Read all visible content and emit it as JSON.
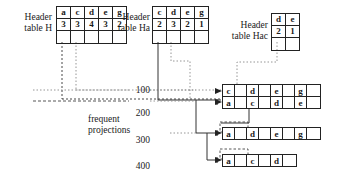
{
  "diagram": {
    "header_tables": [
      {
        "id": "H",
        "label_line1": "Header",
        "label_line2": "table H",
        "items": [
          "a",
          "c",
          "d",
          "e",
          "g"
        ],
        "counts": [
          "3",
          "3",
          "4",
          "3",
          "2"
        ],
        "link_row": [
          "",
          "",
          "",
          "",
          ""
        ]
      },
      {
        "id": "Ha",
        "label_line1": "Header",
        "label_line2": "table Ha",
        "items": [
          "c",
          "d",
          "e",
          "g"
        ],
        "counts": [
          "2",
          "3",
          "2",
          "1"
        ],
        "link_row": [
          "",
          "",
          "",
          ""
        ]
      },
      {
        "id": "Hac",
        "label_line1": "Header",
        "label_line2": "table Hac",
        "items": [
          "d",
          "e"
        ],
        "counts": [
          "2",
          "1"
        ],
        "link_row": [
          "",
          ""
        ]
      }
    ],
    "frequent_projections_label_line1": "frequent",
    "frequent_projections_label_line2": "projections",
    "transaction_ids": [
      "100",
      "200",
      "300",
      "400"
    ],
    "projection_rows": [
      {
        "tid": "100",
        "cells": [
          "c",
          "",
          "d",
          "",
          "e",
          "",
          "g",
          ""
        ]
      },
      {
        "tid": "200",
        "cells": [
          "a",
          "",
          "c",
          "",
          "d",
          "",
          "e",
          ""
        ]
      },
      {
        "tid": "300",
        "cells": [
          "a",
          "",
          "d",
          "",
          "e",
          "",
          "g",
          ""
        ]
      },
      {
        "tid": "400",
        "cells": [
          "a",
          "",
          "c",
          "",
          "d",
          ""
        ]
      }
    ],
    "colors": {
      "stroke": "#222222",
      "text": "#1a1a1a",
      "background": "#ffffff"
    }
  }
}
